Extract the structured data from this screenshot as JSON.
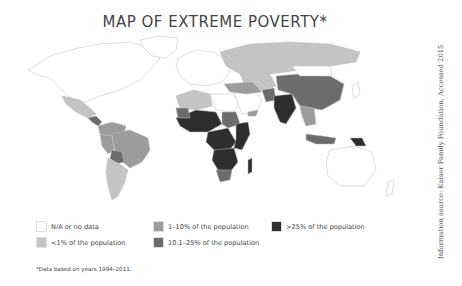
{
  "title": "MAP OF EXTREME POVERTY*",
  "colors": {
    "na": "#ffffff",
    "lt1": "#c4c4c4",
    "p1_10": "#9c9c9c",
    "p10_25": "#6c6c6c",
    "gt25": "#2e2e2e",
    "border": "#bbbbbb"
  },
  "legend": [
    {
      "key": "na",
      "label": "N/A or no data"
    },
    {
      "key": "lt1",
      "label": "<1% of the population"
    },
    {
      "key": "p1_10",
      "label": "1–10% of the population"
    },
    {
      "key": "p10_25",
      "label": "10.1–25% of the population"
    },
    {
      "key": "gt25",
      "label": ">25% of the population"
    }
  ],
  "footnote": "*Data based on years 1994–2011.",
  "source": "Information source: Kaiser Family Foundation, Accessed 2015",
  "regions": [
    {
      "name": "north-america",
      "category": "na"
    },
    {
      "name": "greenland",
      "category": "na"
    },
    {
      "name": "mexico",
      "category": "lt1"
    },
    {
      "name": "central-america",
      "category": "p10_25"
    },
    {
      "name": "colombia-venezuela",
      "category": "p1_10"
    },
    {
      "name": "brazil",
      "category": "p1_10"
    },
    {
      "name": "peru",
      "category": "p1_10"
    },
    {
      "name": "bolivia",
      "category": "p10_25"
    },
    {
      "name": "argentina-chile",
      "category": "lt1"
    },
    {
      "name": "europe",
      "category": "na"
    },
    {
      "name": "russia",
      "category": "lt1"
    },
    {
      "name": "central-asia",
      "category": "lt1"
    },
    {
      "name": "north-africa-west",
      "category": "lt1"
    },
    {
      "name": "north-africa-east",
      "category": "na"
    },
    {
      "name": "west-africa",
      "category": "gt25"
    },
    {
      "name": "mauritania",
      "category": "p10_25"
    },
    {
      "name": "sudan",
      "category": "p10_25"
    },
    {
      "name": "central-africa",
      "category": "gt25"
    },
    {
      "name": "east-africa",
      "category": "gt25"
    },
    {
      "name": "southern-africa",
      "category": "gt25"
    },
    {
      "name": "south-africa",
      "category": "p10_25"
    },
    {
      "name": "madagascar",
      "category": "gt25"
    },
    {
      "name": "middle-east",
      "category": "na"
    },
    {
      "name": "yemen",
      "category": "p1_10"
    },
    {
      "name": "iran-turkey",
      "category": "p1_10"
    },
    {
      "name": "pakistan",
      "category": "p10_25"
    },
    {
      "name": "india",
      "category": "gt25"
    },
    {
      "name": "china",
      "category": "p10_25"
    },
    {
      "name": "mongolia",
      "category": "na"
    },
    {
      "name": "southeast-asia",
      "category": "p1_10"
    },
    {
      "name": "indonesia",
      "category": "p10_25"
    },
    {
      "name": "papua-new-guinea",
      "category": "gt25"
    },
    {
      "name": "australia",
      "category": "na"
    },
    {
      "name": "new-zealand",
      "category": "na"
    },
    {
      "name": "japan",
      "category": "na"
    }
  ]
}
